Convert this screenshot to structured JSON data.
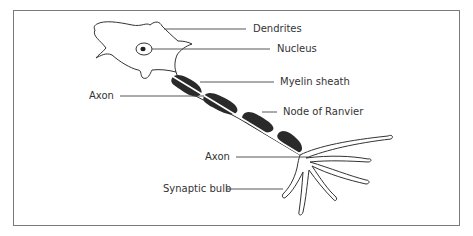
{
  "diagram": {
    "labels": {
      "dendrites": "Dendrites",
      "nucleus": "Nucleus",
      "myelin_sheath": "Myelin sheath",
      "axon_upper": "Axon",
      "node_of_ranvier": "Node of Ranvier",
      "axon_lower": "Axon",
      "synaptic_bulb": "Synaptic bulb"
    },
    "colors": {
      "outline": "#333333",
      "myelin": "#2a2a2a",
      "frame": "#7a7a7a",
      "background": "#ffffff"
    }
  }
}
